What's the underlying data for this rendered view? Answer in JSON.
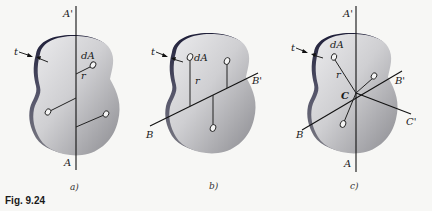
{
  "figure": {
    "caption": "Fig. 9.24",
    "colors": {
      "background": "#f7f7f5",
      "plate_light": "#d9d9db",
      "plate_dark": "#8e8e92",
      "edge": "#2a2a40",
      "line": "#111111"
    },
    "panels": [
      {
        "id": "a",
        "sublabel": "a)",
        "thickness_label": "t",
        "element_label": "dA",
        "radius_label": "r",
        "axis_top_label": "A'",
        "axis_bottom_label": "A"
      },
      {
        "id": "b",
        "sublabel": "b)",
        "thickness_label": "t",
        "element_label": "dA",
        "radius_label": "r",
        "axis_left_label": "B",
        "axis_right_label": "B'"
      },
      {
        "id": "c",
        "sublabel": "c)",
        "thickness_label": "t",
        "element_label": "dA",
        "radius_label": "r",
        "axis_top_label": "A'",
        "axis_bottom_label": "A",
        "axis_b_left_label": "B",
        "axis_b_right_label": "B'",
        "axis_c_right_label": "C'",
        "centroid_label": "C"
      }
    ]
  }
}
